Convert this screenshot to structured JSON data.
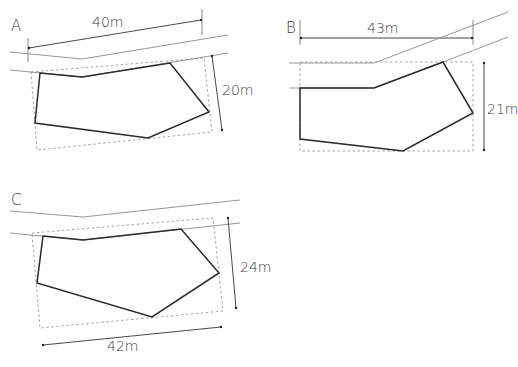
{
  "panels": [
    {
      "id": "A",
      "label": "A",
      "dimensions": {
        "width": "40m",
        "height": "20m"
      }
    },
    {
      "id": "B",
      "label": "B",
      "dimensions": {
        "width": "43m",
        "height": "21m"
      }
    },
    {
      "id": "C",
      "label": "C",
      "dimensions": {
        "width": "42m",
        "height": "24m"
      }
    }
  ],
  "colors": {
    "plot_outline": "#2a2a2a",
    "road_lines": "#8a8a8a",
    "bounding_box": "#9a9a9a",
    "text": "#3a3a3a"
  }
}
